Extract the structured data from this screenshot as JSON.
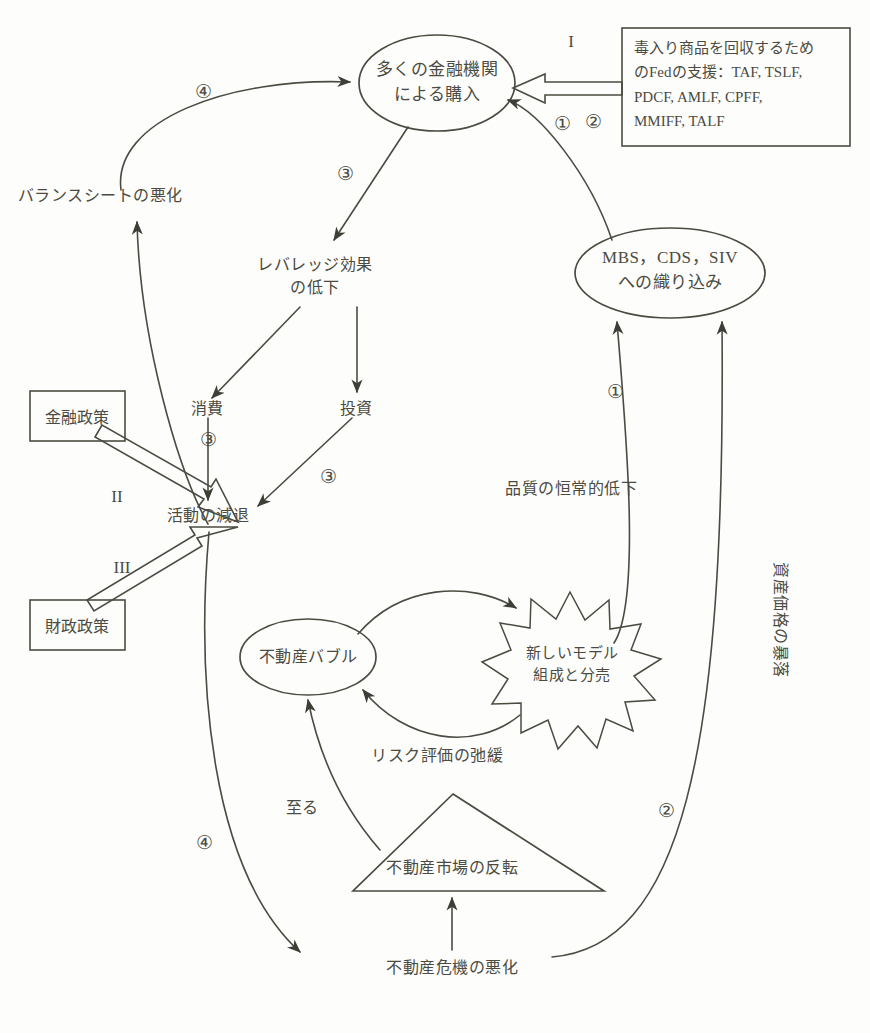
{
  "diagram": {
    "nodes": {
      "purchase_ellipse": "多くの金融機関\nによる購入",
      "fed_support_box": "毒入り商品を回収するため\nのFedの支援：TAF, TSLF,\nPDCF, AMLF, CPFF,\nMMIFF, TALF",
      "mbs_ellipse": "MBS，CDS，SIV\nへの織り込み",
      "balance_sheet": "バランスシートの悪化",
      "leverage_drop": "レバレッジ効果\nの低下",
      "consumption": "消費",
      "investment": "投資",
      "monetary_policy": "金融政策",
      "fiscal_policy": "財政政策",
      "activity_decline": "活動の減退",
      "quality_decline": "品質の恒常的低下",
      "asset_price_crash": "資産価格の暴落",
      "housing_bubble": "不動産バブル",
      "new_model_burst": "新しいモデル\n組成と分売",
      "risk_relaxation": "リスク評価の弛緩",
      "lead_to": "至る",
      "market_reversal": "不動産市場の反転",
      "housing_crisis": "不動産危機の悪化"
    },
    "markers": {
      "roman_1": "I",
      "roman_2": "II",
      "roman_3": "III",
      "circled_1_top": "①",
      "circled_1_right": "①",
      "circled_2_top": "②",
      "circled_2_bottom": "②",
      "circled_3_leverage": "③",
      "circled_3_consumption": "③",
      "circled_3_investment": "③",
      "circled_4_top": "④",
      "circled_4_bottom": "④"
    },
    "colors": {
      "stroke": "#4b4b42",
      "text": "#4b4b42",
      "background": "#fdfdfb"
    }
  }
}
